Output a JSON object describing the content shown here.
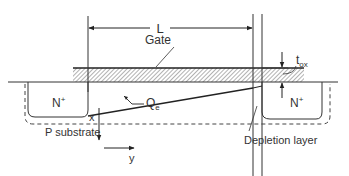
{
  "diagram": {
    "labels": {
      "length": "L",
      "gate": "Gate",
      "oxide_thickness": "t",
      "oxide_thickness_sub": "ox",
      "source": "N",
      "source_sup": "+",
      "drain": "N",
      "drain_sup": "+",
      "charge": "Q",
      "charge_sub": "e",
      "x_axis": "x",
      "y_axis": "y",
      "substrate": "P substrate",
      "depletion": "Depletion layer"
    },
    "colors": {
      "line": "#222222",
      "text": "#333333",
      "hatch": "#555555"
    }
  }
}
